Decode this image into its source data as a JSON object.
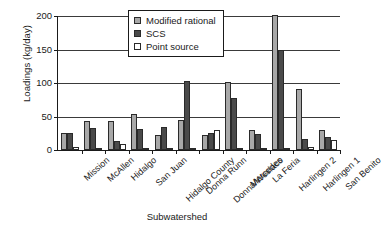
{
  "chart_data": {
    "type": "bar",
    "title": "",
    "xlabel": "Subwatershed",
    "ylabel": "Loadings (kg/day)",
    "ylim": [
      0,
      200
    ],
    "yticks": [
      0,
      50,
      100,
      150,
      200
    ],
    "ytick_labels": [
      "0",
      "50",
      "100",
      "150",
      "200"
    ],
    "grid": true,
    "legend_position": "top-center",
    "categories": [
      "Mission",
      "McAllen",
      "Hidalgo",
      "San Juan",
      "Hidalgo County",
      "Donna Runn",
      "Donna/Weslaco",
      "Mercedes",
      "La Feria",
      "Harlingen 2",
      "Harlingen 1",
      "San Benito"
    ],
    "series": [
      {
        "name": "Modified rational",
        "color": "#a8a8a8",
        "values": [
          25,
          44,
          44,
          54,
          22,
          45,
          23,
          101,
          30,
          202,
          91,
          30
        ]
      },
      {
        "name": "SCS",
        "color": "#4a4a4a",
        "values": [
          25,
          33,
          14,
          31,
          35,
          103,
          25,
          78,
          24,
          149,
          16,
          19
        ]
      },
      {
        "name": "Point source",
        "color": "#ffffff",
        "values": [
          5,
          3,
          9,
          1,
          3,
          1,
          30,
          3,
          1,
          3,
          5,
          15
        ]
      }
    ]
  }
}
